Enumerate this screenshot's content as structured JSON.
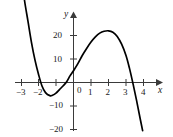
{
  "chart_data": {
    "type": "line",
    "title": "",
    "subtitle": "",
    "xlabel": "x",
    "ylabel": "y",
    "xlim": [
      -3.4,
      4.4
    ],
    "ylim": [
      -22,
      26
    ],
    "grid": false,
    "legend": null,
    "axis_style": "arrowed-cartesian-axes",
    "x_ticks": [
      -3,
      -2,
      -1,
      1,
      2,
      3,
      4
    ],
    "x_tick_labels": [
      "−3",
      "−2",
      "",
      "1",
      "2",
      "3",
      "4"
    ],
    "y_ticks": [
      -20,
      -10,
      10,
      20
    ],
    "y_tick_labels": [
      "−20",
      "−10",
      "10",
      "20"
    ],
    "origin_label": "0",
    "curve_color": "#000000",
    "axis_color": "#3a3a3a",
    "series": [
      {
        "name": "cubic",
        "roots": [
          -2.2,
          -0.4,
          3.4
        ],
        "local_minimum": {
          "x": -1.35,
          "y": -5.5
        },
        "local_maximum": {
          "x": 2.0,
          "y": 22
        },
        "x": [
          -2.95,
          -2.8,
          -2.6,
          -2.4,
          -2.2,
          -2.0,
          -1.8,
          -1.6,
          -1.35,
          -1.2,
          -1.0,
          -0.8,
          -0.6,
          -0.4,
          -0.2,
          0,
          0.25,
          0.5,
          0.75,
          1.0,
          1.25,
          1.5,
          1.75,
          2.0,
          2.25,
          2.5,
          2.75,
          3.0,
          3.2,
          3.4,
          3.6,
          3.8,
          3.95
        ],
        "y": [
          44,
          35,
          26,
          17,
          9.5,
          3.5,
          -1.5,
          -4.3,
          -5.6,
          -5.4,
          -4.5,
          -3.0,
          -1.5,
          0.2,
          2.8,
          5.0,
          8.0,
          11.5,
          14.5,
          17.2,
          19.4,
          21.0,
          21.8,
          22.0,
          21.4,
          19.6,
          16.3,
          11.5,
          6.0,
          -0.5,
          -7.5,
          -15.0,
          -20.5
        ]
      }
    ]
  },
  "labels": {
    "y_axis_name": "y",
    "x_axis_name": "x",
    "zero": "0",
    "x_neg3": "−3",
    "x_neg2": "−2",
    "x_1": "1",
    "x_2": "2",
    "x_3": "3",
    "x_4": "4",
    "y_20": "20",
    "y_10": "10",
    "y_neg10": "−10",
    "y_neg20": "−20"
  }
}
